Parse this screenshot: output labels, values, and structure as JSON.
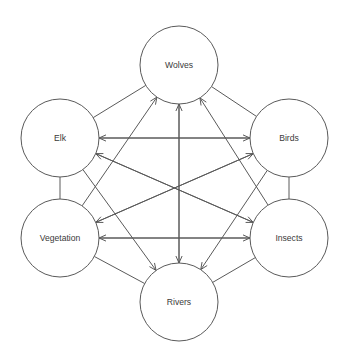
{
  "diagram": {
    "type": "node-link-graph",
    "canvas": {
      "width": 347,
      "height": 361,
      "background": "#ffffff"
    },
    "style": {
      "stroke": "#5a5a5a",
      "node_fill": "#ffffff",
      "label_color": "#3a3a3a",
      "node_radius": 39,
      "stroke_width": 1
    },
    "nodes": [
      {
        "id": "wolves",
        "label": "Wolves",
        "cx": 179,
        "cy": 65,
        "r": 39
      },
      {
        "id": "elk",
        "label": "Elk",
        "cx": 60,
        "cy": 138,
        "r": 39
      },
      {
        "id": "birds",
        "label": "Birds",
        "cx": 289,
        "cy": 138,
        "r": 39
      },
      {
        "id": "vegetation",
        "label": "Vegetation",
        "cx": 60,
        "cy": 238,
        "r": 39
      },
      {
        "id": "insects",
        "label": "Insects",
        "cx": 289,
        "cy": 238,
        "r": 39
      },
      {
        "id": "rivers",
        "label": "Rivers",
        "cx": 179,
        "cy": 302,
        "r": 39
      }
    ],
    "edges": [
      {
        "id": "e-wolves-elk",
        "from": "wolves",
        "to": "elk",
        "arrow": false
      },
      {
        "id": "e-wolves-birds",
        "from": "wolves",
        "to": "birds",
        "arrow": false
      },
      {
        "id": "e-elk-vegetation",
        "from": "elk",
        "to": "vegetation",
        "arrow": false
      },
      {
        "id": "e-birds-insects",
        "from": "birds",
        "to": "insects",
        "arrow": false
      },
      {
        "id": "e-vegetation-rivers",
        "from": "vegetation",
        "to": "rivers",
        "arrow": false
      },
      {
        "id": "e-insects-rivers",
        "from": "insects",
        "to": "rivers",
        "arrow": false
      },
      {
        "id": "e-elk-birds",
        "from": "elk",
        "to": "birds",
        "arrow": true
      },
      {
        "id": "e-birds-elk",
        "from": "birds",
        "to": "elk",
        "arrow": true
      },
      {
        "id": "e-vegetation-insects",
        "from": "vegetation",
        "to": "insects",
        "arrow": true
      },
      {
        "id": "e-insects-vegetation",
        "from": "insects",
        "to": "vegetation",
        "arrow": true
      },
      {
        "id": "e-elk-insects",
        "from": "elk",
        "to": "insects",
        "arrow": true
      },
      {
        "id": "e-insects-elk",
        "from": "insects",
        "to": "elk",
        "arrow": true
      },
      {
        "id": "e-vegetation-birds",
        "from": "vegetation",
        "to": "birds",
        "arrow": true
      },
      {
        "id": "e-birds-vegetation",
        "from": "birds",
        "to": "vegetation",
        "arrow": true
      },
      {
        "id": "e-vegetation-wolves",
        "from": "vegetation",
        "to": "wolves",
        "arrow": true
      },
      {
        "id": "e-insects-wolves",
        "from": "insects",
        "to": "wolves",
        "arrow": true
      },
      {
        "id": "e-rivers-wolves",
        "from": "rivers",
        "to": "wolves",
        "arrow": true
      },
      {
        "id": "e-wolves-rivers",
        "from": "wolves",
        "to": "rivers",
        "arrow": true
      },
      {
        "id": "e-elk-rivers",
        "from": "elk",
        "to": "rivers",
        "arrow": true
      },
      {
        "id": "e-birds-rivers",
        "from": "birds",
        "to": "rivers",
        "arrow": true
      }
    ]
  }
}
